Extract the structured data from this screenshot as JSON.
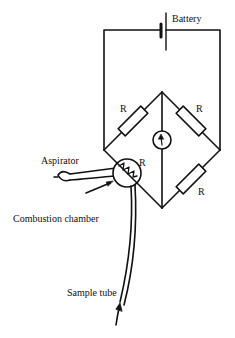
{
  "diagram": {
    "type": "wheatstone-bridge-combustion-gas-detector",
    "labels": {
      "battery": "Battery",
      "aspirator": "Aspirator",
      "combustion_chamber": "Combustion chamber",
      "sample_tube": "Sample tube"
    },
    "resistors": [
      {
        "id": "r-top-left",
        "label": "R"
      },
      {
        "id": "r-top-right",
        "label": "R"
      },
      {
        "id": "r-bottom-right",
        "label": "R"
      },
      {
        "id": "r-chamber",
        "label": "R"
      }
    ],
    "components": {
      "galvanometer": "galvanometer-icon",
      "battery": "battery-icon",
      "heating_element": "filament-icon"
    },
    "colors": {
      "line": "#111111",
      "background": "#ffffff"
    }
  }
}
